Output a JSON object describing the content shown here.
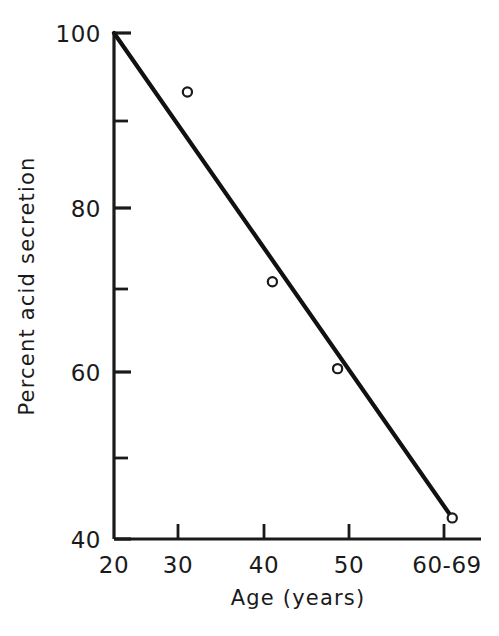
{
  "chart_data": {
    "type": "scatter",
    "title": "",
    "xlabel": "Age (years)",
    "ylabel": "Percent acid secretion",
    "xlim": [
      20,
      70
    ],
    "ylim": [
      40,
      100
    ],
    "grid": false,
    "legend": null,
    "x_tick_labels": [
      "20",
      "30",
      "40",
      "50",
      "60-69"
    ],
    "x_tick_values": [
      20,
      30,
      40,
      50,
      60
    ],
    "y_tick_labels": [
      "40",
      "60",
      "80",
      "100"
    ],
    "y_tick_values": [
      40,
      60,
      80,
      100
    ],
    "y_minor_tick_values": [
      50,
      70,
      90
    ],
    "marker_style": "open-circle",
    "points": [
      {
        "x": 28.9,
        "y": 93.0
      },
      {
        "x": 39.2,
        "y": 70.5
      },
      {
        "x": 47.1,
        "y": 60.2
      },
      {
        "x": 61.0,
        "y": 42.5
      }
    ],
    "series": [
      {
        "name": "Percent acid secretion",
        "x": [
          28.9,
          39.2,
          47.1,
          61.0
        ],
        "values": [
          93.0,
          70.5,
          60.2,
          42.5
        ]
      }
    ],
    "trend_line": {
      "type": "line",
      "x": [
        20.0,
        61.0
      ],
      "values": [
        100.0,
        42.5
      ]
    },
    "colors": {
      "axis": "#1a1a1a",
      "line": "#111111",
      "marker": "#1a1a1a",
      "background": "#ffffff"
    }
  },
  "axes": {
    "x_title": "Age (years)",
    "y_title": "Percent acid secretion",
    "x_labels": [
      "20",
      "30",
      "40",
      "50",
      "60-69"
    ],
    "y_labels": [
      "100",
      "80",
      "60",
      "40"
    ]
  }
}
